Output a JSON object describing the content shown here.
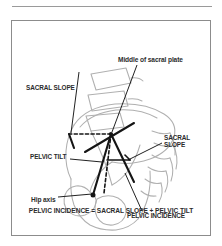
{
  "figure": {
    "title_caption": "PELVIC INCIDENCE = SACRAL SLOPE + PELVIC TILT",
    "colors": {
      "anatomy_outline": "#b0b0b0",
      "measurement_line": "#1a1a1a",
      "text": "#2b2b2b",
      "frame": "#8c8c8c",
      "background": "#ffffff"
    },
    "labels": {
      "sacral_slope_left": "SACRAL SLOPE",
      "middle_of_sacral_plate": "Middle of sacral plate",
      "sacral_slope_right_line1": "SACRAL",
      "sacral_slope_right_line2": "SLOPE",
      "pelvic_tilt": "PELVIC TILT",
      "hip_axis": "Hip axis",
      "pelvic_incidence": "PELVIC INCIDENCE"
    },
    "diagram_description": "Lateral view line drawing of lumbar spine and pelvis illustrating spinopelvic sagittal balance parameters: sacral slope, pelvic tilt and pelvic incidence, measured from the middle of the sacral plate and the hip axis.",
    "anatomy_parts": [
      "lumbar-vertebral-bodies",
      "sacrum",
      "iliac-wing",
      "ischium",
      "pubis",
      "femoral-head"
    ],
    "reference_points": [
      "middle-of-sacral-plate",
      "hip-axis"
    ],
    "reference_lines": [
      "horizontal-dashed-reference",
      "vertical-dashed-reference",
      "sacral-plate-line",
      "hip-axis-to-sacral-plate-line"
    ],
    "angles": [
      "sacral-slope",
      "pelvic-tilt",
      "pelvic-incidence"
    ]
  }
}
